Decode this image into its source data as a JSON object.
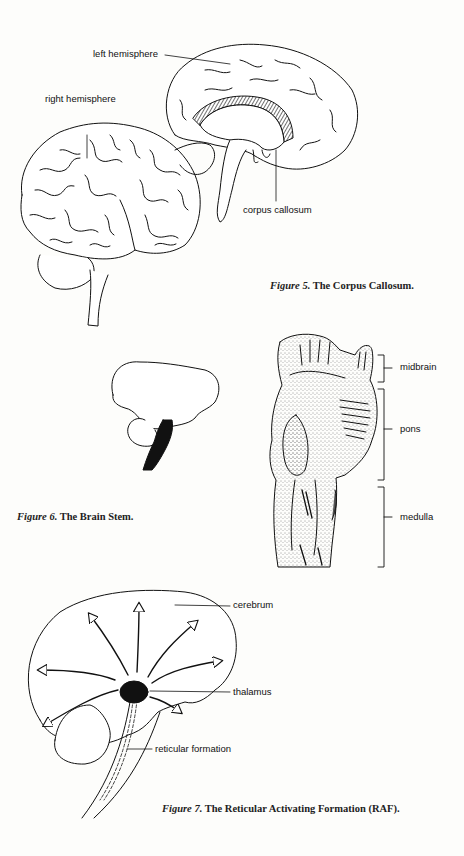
{
  "figures": [
    {
      "id": "figure5",
      "caption_prefix": "Figure 5.",
      "caption_text": "The Corpus Callosum.",
      "labels": {
        "left_hemisphere": "left hemisphere",
        "right_hemisphere": "right hemisphere",
        "corpus_callosum": "corpus callosum"
      }
    },
    {
      "id": "figure6",
      "caption_prefix": "Figure 6.",
      "caption_text": "The Brain Stem.",
      "labels": {
        "midbrain": "midbrain",
        "pons": "pons",
        "medulla": "medulla"
      }
    },
    {
      "id": "figure7",
      "caption_prefix": "Figure 7.",
      "caption_text": "The Reticular Activating Formation (RAF).",
      "labels": {
        "cerebrum": "cerebrum",
        "thalamus": "thalamus",
        "reticular_formation": "reticular formation"
      }
    }
  ],
  "colors": {
    "background": "#fdfdfb",
    "ink": "#111111"
  }
}
